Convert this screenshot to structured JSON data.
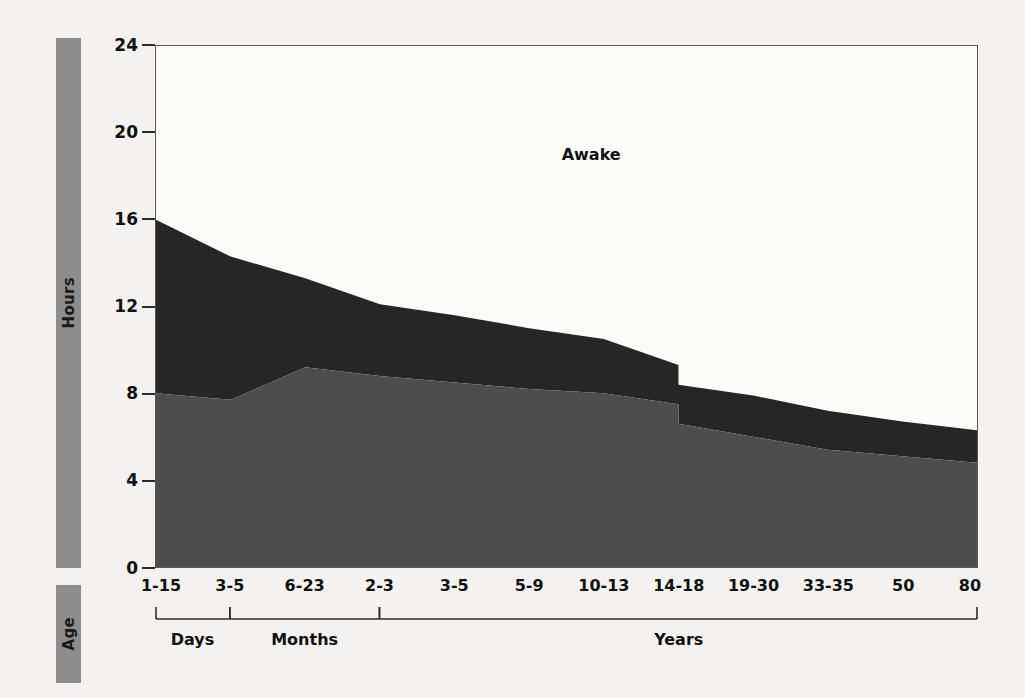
{
  "axis_titles": {
    "y": "Hours",
    "x": "Age"
  },
  "colors": {
    "awake": "#fbfbfa",
    "rem": "#262626",
    "nonrem": "#4d4d4d",
    "axis_bar": "#8d8d8d",
    "frame": "#58595b",
    "background": "#f3f2f0"
  },
  "chart_data": {
    "type": "area",
    "title": "",
    "xlabel": "Age",
    "ylabel": "Hours",
    "ylim": [
      0,
      24
    ],
    "yticks": [
      0,
      4,
      8,
      12,
      16,
      20,
      24
    ],
    "grid": false,
    "legend_position": "in-plot",
    "stacked": true,
    "categories": [
      "1-15",
      "3-5",
      "6-23",
      "2-3",
      "3-5",
      "5-9",
      "10-13",
      "14-18",
      "19-30",
      "33-35",
      "50",
      "80"
    ],
    "category_units": [
      "Days",
      "Months",
      "Months",
      "Years",
      "Years",
      "Years",
      "Years",
      "Years",
      "Years",
      "Years",
      "Years",
      "Years"
    ],
    "group_brackets": [
      {
        "label": "Days",
        "start_index": 0,
        "end_index": 1
      },
      {
        "label": "Months",
        "start_index": 1,
        "end_index": 3
      },
      {
        "label": "Years",
        "start_index": 3,
        "end_index": 11
      }
    ],
    "series": [
      {
        "name": "Non-REM sleep",
        "color": "#4d4d4d",
        "values": [
          8.0,
          7.7,
          9.2,
          8.8,
          8.5,
          8.2,
          8.0,
          6.6,
          6.0,
          5.4,
          5.1,
          4.8
        ]
      },
      {
        "name": "REM sleep",
        "color": "#262626",
        "values": [
          8.0,
          6.6,
          4.1,
          3.3,
          3.1,
          2.8,
          2.5,
          1.8,
          1.9,
          1.8,
          1.6,
          1.5
        ]
      },
      {
        "name": "Awake",
        "color": "#fbfbfa",
        "values": [
          8.0,
          9.7,
          10.7,
          11.9,
          12.4,
          13.0,
          13.5,
          15.6,
          16.1,
          16.8,
          17.3,
          17.7
        ]
      }
    ],
    "total_sleep_hours": [
      16.0,
      14.3,
      13.3,
      12.1,
      11.6,
      11.0,
      10.5,
      8.4,
      7.9,
      7.2,
      6.7,
      6.3
    ],
    "total_sleep_break": {
      "at_category": "14-18",
      "value_before_drop": 9.3,
      "value_after_drop": 8.4
    },
    "annotations": [
      {
        "text": "Awake",
        "x_fraction": 0.53,
        "y_hours": 19.0
      }
    ]
  }
}
